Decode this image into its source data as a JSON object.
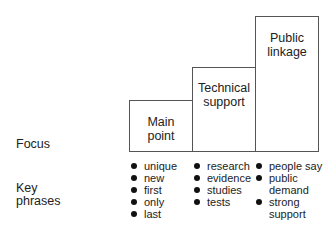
{
  "row_labels": {
    "focus": "Focus",
    "key_phrases_line1": "Key",
    "key_phrases_line2": "phrases"
  },
  "stages": [
    {
      "label_line1": "Main",
      "label_line2": "point",
      "phrases": [
        {
          "text": "unique",
          "bullet": true
        },
        {
          "text": "new",
          "bullet": true
        },
        {
          "text": "first",
          "bullet": true
        },
        {
          "text": "only",
          "bullet": true
        },
        {
          "text": "last",
          "bullet": true
        }
      ]
    },
    {
      "label_line1": "Technical",
      "label_line2": "support",
      "phrases": [
        {
          "text": "research",
          "bullet": true
        },
        {
          "text": "evidence",
          "bullet": true
        },
        {
          "text": "studies",
          "bullet": true
        },
        {
          "text": "tests",
          "bullet": true
        }
      ]
    },
    {
      "label_line1": "Public",
      "label_line2": "linkage",
      "phrases": [
        {
          "text": "people say",
          "bullet": true
        },
        {
          "text": "public",
          "bullet": true
        },
        {
          "text": "demand",
          "bullet": false
        },
        {
          "text": "strong",
          "bullet": true
        },
        {
          "text": "support",
          "bullet": false
        }
      ]
    }
  ]
}
